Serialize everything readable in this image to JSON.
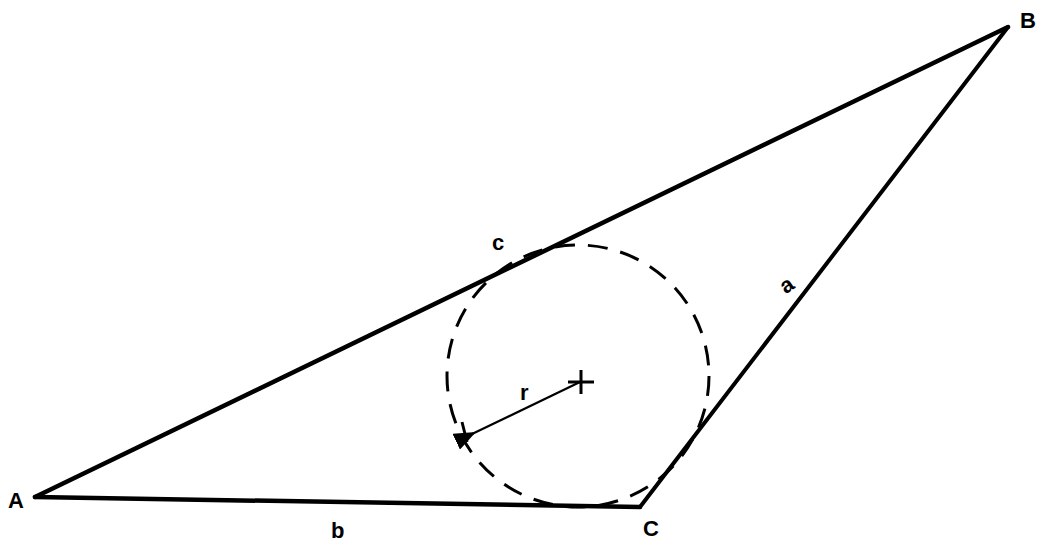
{
  "diagram": {
    "stroke_color": "#000000",
    "background": "#ffffff",
    "vertices": {
      "A": {
        "label": "A",
        "x": 35,
        "y": 497
      },
      "B": {
        "label": "B",
        "x": 1008,
        "y": 27
      },
      "C": {
        "label": "C",
        "x": 640,
        "y": 507
      }
    },
    "sides": {
      "a": {
        "label": "a",
        "from": "B",
        "to": "C"
      },
      "b": {
        "label": "b",
        "from": "A",
        "to": "C"
      },
      "c": {
        "label": "c",
        "from": "A",
        "to": "B"
      }
    },
    "incircle": {
      "cx": 578,
      "cy": 376,
      "r": 131,
      "style": "dashed"
    },
    "center_marker": {
      "symbol": "+",
      "x": 580,
      "y": 382
    },
    "radius": {
      "label": "r",
      "from": {
        "x": 580,
        "y": 382
      },
      "to": {
        "x": 466,
        "y": 436
      }
    }
  }
}
